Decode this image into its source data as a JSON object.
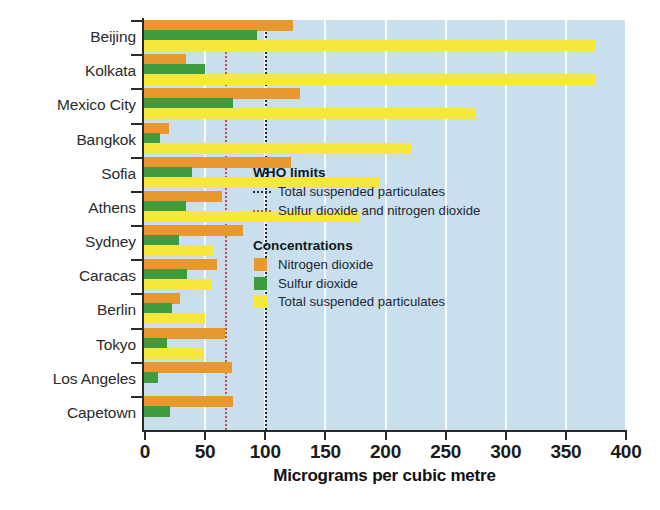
{
  "chart_data": {
    "type": "bar",
    "orientation": "horizontal",
    "title": "",
    "xlabel": "Micrograms per cubic metre",
    "ylabel": "",
    "xlim": [
      0,
      400
    ],
    "xticks": [
      0,
      50,
      100,
      150,
      200,
      250,
      300,
      350,
      400
    ],
    "grid": "vertical-white-gridlines",
    "legend_position": "inside-right",
    "categories": [
      "Beijing",
      "Kolkata",
      "Mexico City",
      "Bangkok",
      "Sofia",
      "Athens",
      "Sydney",
      "Caracas",
      "Berlin",
      "Tokyo",
      "Los Angeles",
      "Capetown"
    ],
    "series": [
      {
        "name": "Nitrogen dioxide",
        "color": "#e8992e",
        "values": [
          124,
          35,
          130,
          21,
          122,
          65,
          82,
          61,
          30,
          67,
          73,
          74
        ]
      },
      {
        "name": "Sulfur dioxide",
        "color": "#3e9b3e",
        "values": [
          94,
          51,
          74,
          13,
          40,
          35,
          29,
          36,
          23,
          19,
          12,
          22
        ]
      },
      {
        "name": "Total suspended particulates",
        "color": "#f5e73c",
        "values": [
          376,
          375,
          276,
          222,
          196,
          179,
          57,
          56,
          51,
          50,
          0,
          0
        ]
      }
    ],
    "reference_lines": [
      {
        "name": "Total suspended particulates",
        "value": 101,
        "color": "#1f2f4d",
        "style": "dotted"
      },
      {
        "name": "Sulfur dioxide and nitrogen dioxide",
        "value": 67,
        "color": "#b8583c",
        "style": "dotted"
      }
    ]
  },
  "axis": {
    "x_title": "Micrograms per cubic metre",
    "x_tick_labels": [
      "0",
      "50",
      "100",
      "150",
      "200",
      "250",
      "300",
      "350",
      "400"
    ]
  },
  "legend": {
    "who_heading": "WHO limits",
    "who_items": [
      {
        "label": "Total suspended particulates",
        "marker": "dotted-line-navy"
      },
      {
        "label": "Sulfur dioxide and nitrogen dioxide",
        "marker": "dotted-line-red"
      }
    ],
    "conc_heading": "Concentrations",
    "conc_items": [
      {
        "label": "Nitrogen dioxide",
        "marker": "swatch-orange"
      },
      {
        "label": "Sulfur dioxide",
        "marker": "swatch-green"
      },
      {
        "label": "Total suspended particulates",
        "marker": "swatch-yellow"
      }
    ]
  },
  "colors": {
    "background": "#c9dfee",
    "nitrogen_dioxide": "#e8992e",
    "sulfur_dioxide": "#3e9b3e",
    "total_suspended_particulates": "#f5e73c",
    "who_tsp_line": "#1f2f4d",
    "who_sox_nox_line": "#b8583c"
  }
}
